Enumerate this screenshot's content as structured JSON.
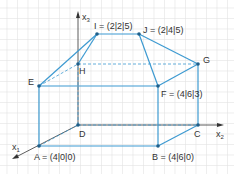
{
  "colors": {
    "edge": "#3d9ad1",
    "axis": "#333333",
    "grid": "#e3e3e3",
    "point": "#1f5f8a",
    "label": "#333333"
  },
  "axes": {
    "x1": {
      "label": "x",
      "sub": "1"
    },
    "x2": {
      "label": "x",
      "sub": "2"
    },
    "x3": {
      "label": "x",
      "sub": "3"
    }
  },
  "points": {
    "A": {
      "label": "A = (4|0|0)",
      "x": 39,
      "y": 146
    },
    "B": {
      "label": "B = (4|6|0)",
      "x": 158,
      "y": 146
    },
    "C": {
      "label": "C",
      "x": 198,
      "y": 125
    },
    "D": {
      "label": "D",
      "x": 78,
      "y": 125
    },
    "E": {
      "label": "E",
      "x": 39,
      "y": 86
    },
    "F": {
      "label": "F = (4|6|3)",
      "x": 158,
      "y": 86
    },
    "G": {
      "label": "G",
      "x": 198,
      "y": 64
    },
    "H": {
      "label": "H",
      "x": 78,
      "y": 64
    },
    "I": {
      "label": "I = (2|2|5)",
      "x": 97,
      "y": 34
    },
    "J": {
      "label": "J = (2|4|5)",
      "x": 139,
      "y": 34
    }
  }
}
